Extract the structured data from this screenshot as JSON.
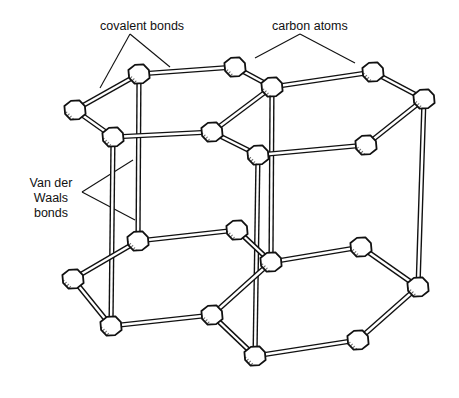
{
  "diagram": {
    "type": "graphite crystal structure (ball-and-stick)",
    "labels": {
      "covalent_bonds": "covalent bonds",
      "carbon_atoms": "carbon atoms",
      "van_der_waals_line1": "Van der",
      "van_der_waals_line2": "Waals",
      "van_der_waals_line3": "bonds"
    },
    "colors": {
      "ink": "#111111",
      "background": "#ffffff",
      "bond_fill": "#ffffff"
    },
    "layers": [
      {
        "name": "top-layer",
        "atoms": [
          [
            75,
            110
          ],
          [
            139,
            74
          ],
          [
            235,
            67
          ],
          [
            272,
            87
          ],
          [
            373,
            72
          ],
          [
            424,
            99
          ],
          [
            366,
            145
          ],
          [
            258,
            155
          ],
          [
            212,
            132
          ],
          [
            113,
            137
          ]
        ]
      },
      {
        "name": "bottom-layer",
        "atoms": [
          [
            73,
            279
          ],
          [
            138,
            241
          ],
          [
            237,
            230
          ],
          [
            271,
            262
          ],
          [
            361,
            247
          ],
          [
            418,
            287
          ],
          [
            358,
            340
          ],
          [
            255,
            356
          ],
          [
            212,
            315
          ],
          [
            111,
            326
          ]
        ]
      }
    ],
    "covalent_bonds": [
      [
        0,
        1
      ],
      [
        1,
        2
      ],
      [
        2,
        3
      ],
      [
        3,
        4
      ],
      [
        4,
        5
      ],
      [
        5,
        6
      ],
      [
        6,
        7
      ],
      [
        7,
        8
      ],
      [
        8,
        9
      ],
      [
        9,
        0
      ],
      [
        3,
        8
      ]
    ],
    "van_der_waals_bonds": [
      [
        1,
        1
      ],
      [
        9,
        9
      ],
      [
        3,
        3
      ],
      [
        7,
        7
      ],
      [
        5,
        5
      ]
    ]
  }
}
